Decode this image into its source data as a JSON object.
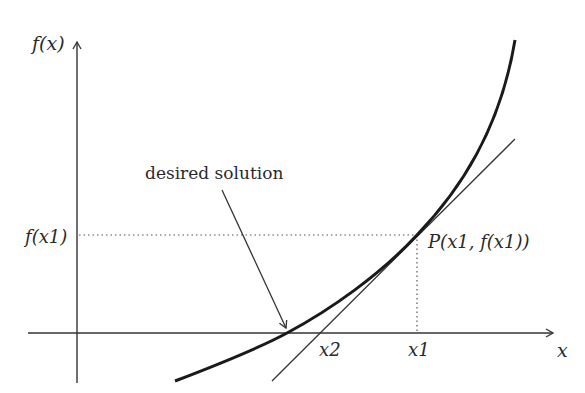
{
  "diagram": {
    "axes": {
      "y_label": "f(x)",
      "x_label": "x"
    },
    "labels": {
      "f_x1": "f(x1)",
      "point_P": "P(x1, f(x1))",
      "x1": "x1",
      "x2": "x2",
      "annotation": "desired solution"
    },
    "colors": {
      "curve": "#1a1a1a",
      "axes": "#333333",
      "tangent": "#333333",
      "guides": "#555555"
    }
  }
}
